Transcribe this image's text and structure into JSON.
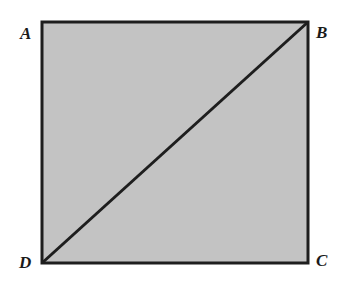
{
  "figure": {
    "shape": "square",
    "fill_color": "#c3c3c3",
    "stroke_color": "#1e1e1e",
    "diagonal": "DB",
    "vertices": {
      "A": {
        "label": "A",
        "x": 42,
        "y": 22
      },
      "B": {
        "label": "B",
        "x": 308,
        "y": 22
      },
      "C": {
        "label": "C",
        "x": 308,
        "y": 263
      },
      "D": {
        "label": "D",
        "x": 42,
        "y": 263
      }
    }
  }
}
